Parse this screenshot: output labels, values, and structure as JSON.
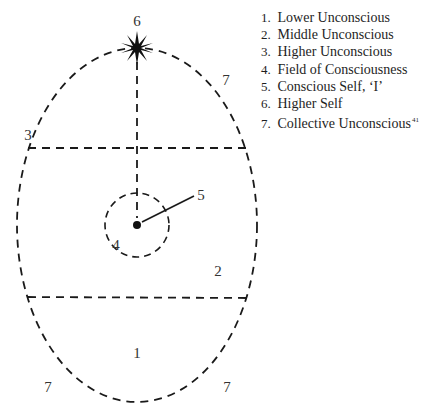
{
  "diagram": {
    "regions": [
      {
        "id": "1",
        "label": "1",
        "x": 137,
        "y": 358
      },
      {
        "id": "2",
        "label": "2",
        "x": 218,
        "y": 276
      },
      {
        "id": "3",
        "label": "3",
        "x": 28,
        "y": 140
      },
      {
        "id": "4",
        "label": "4",
        "x": 116,
        "y": 250
      },
      {
        "id": "5",
        "label": "5",
        "x": 201,
        "y": 200
      },
      {
        "id": "6",
        "label": "6",
        "x": 137,
        "y": 26
      },
      {
        "id": "7a",
        "label": "7",
        "x": 226,
        "y": 85
      },
      {
        "id": "7b",
        "label": "7",
        "x": 48,
        "y": 392
      },
      {
        "id": "7c",
        "label": "7",
        "x": 227,
        "y": 392
      }
    ],
    "shapes": {
      "ellipse": {
        "cx": 137,
        "cy": 225,
        "rx": 120,
        "ry": 177
      },
      "upper_line_y": 148,
      "lower_line_y": 297,
      "inner_circle": {
        "cx": 137,
        "cy": 225,
        "r": 32
      },
      "star_center": [
        137,
        48
      ],
      "self_line": [
        137,
        225,
        194,
        196
      ]
    },
    "stroke_color": "#1a1a1a"
  },
  "legend": {
    "items": [
      {
        "num": "1.",
        "label": "Lower Unconscious"
      },
      {
        "num": "2.",
        "label": "Middle Unconscious"
      },
      {
        "num": "3.",
        "label": "Higher Unconscious"
      },
      {
        "num": "4.",
        "label": "Field of Consciousness"
      },
      {
        "num": "5.",
        "label": "Conscious Self, ‘I’"
      },
      {
        "num": "6.",
        "label": "Higher Self"
      },
      {
        "num": "7.",
        "label": "Collective Unconscious",
        "footnote": "41"
      }
    ]
  }
}
